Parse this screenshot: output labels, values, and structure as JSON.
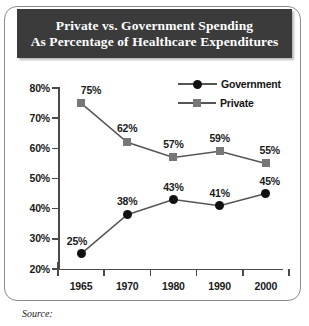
{
  "title": {
    "line1": "Private vs. Government Spending",
    "line2": "As Percentage of Healthcare Expenditures"
  },
  "source": {
    "label": "Source:"
  },
  "legend": {
    "government": "Government",
    "private": "Private",
    "government_marker": "circle-marker",
    "private_marker": "square-marker"
  },
  "colors": {
    "banner_bg": "#3b3b3b",
    "banner_text": "#ffffff",
    "government": "#111111",
    "private": "#777777",
    "axis": "#4a4a4a",
    "frame": "#8a8a8a"
  },
  "chart_data": {
    "type": "line",
    "title": "Private vs. Government Spending As Percentage of Healthcare Expenditures",
    "xlabel": "",
    "ylabel": "",
    "categories": [
      "1965",
      "1970",
      "1980",
      "1990",
      "2000"
    ],
    "x": [
      1965,
      1970,
      1980,
      1990,
      2000
    ],
    "ylim": [
      20,
      80
    ],
    "yticks": [
      "20%",
      "30%",
      "40%",
      "50%",
      "60%",
      "70%",
      "80%"
    ],
    "ytick_values": [
      20,
      30,
      40,
      50,
      60,
      70,
      80
    ],
    "grid": false,
    "legend_position": "top-right",
    "series": [
      {
        "name": "Government",
        "marker": "circle",
        "color": "#111111",
        "values": [
          25,
          38,
          43,
          41,
          45
        ],
        "labels": [
          "25%",
          "38%",
          "43%",
          "41%",
          "45%"
        ]
      },
      {
        "name": "Private",
        "marker": "square",
        "color": "#777777",
        "values": [
          75,
          62,
          57,
          59,
          55
        ],
        "labels": [
          "75%",
          "62%",
          "57%",
          "59%",
          "55%"
        ]
      }
    ]
  }
}
